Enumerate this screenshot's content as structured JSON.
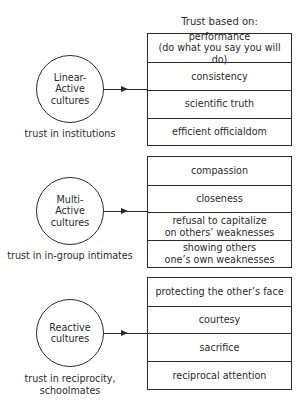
{
  "header": {
    "title": "Trust based on:"
  },
  "groups": [
    {
      "circle_lines": [
        "Linear-",
        "Active",
        "cultures"
      ],
      "caption_lines": [
        "trust in institutions"
      ],
      "items": [
        {
          "lines": [
            "performance",
            "(do what you say you will do)"
          ]
        },
        {
          "lines": [
            "consistency"
          ]
        },
        {
          "lines": [
            "scientific truth"
          ]
        },
        {
          "lines": [
            "efficient officialdom"
          ]
        }
      ]
    },
    {
      "circle_lines": [
        "Multi-",
        "Active",
        "cultures"
      ],
      "caption_lines": [
        "trust in in-group intimates"
      ],
      "items": [
        {
          "lines": [
            "compassion"
          ]
        },
        {
          "lines": [
            "closeness"
          ]
        },
        {
          "lines": [
            "refusal to capitalize",
            "on others’ weaknesses"
          ]
        },
        {
          "lines": [
            "showing others",
            "one’s own weaknesses"
          ]
        }
      ]
    },
    {
      "circle_lines": [
        "Reactive",
        "cultures"
      ],
      "caption_lines": [
        "trust in reciprocity,",
        "schoolmates"
      ],
      "items": [
        {
          "lines": [
            "protecting the other’s face"
          ]
        },
        {
          "lines": [
            "courtesy"
          ]
        },
        {
          "lines": [
            "sacrifice"
          ]
        },
        {
          "lines": [
            "reciprocal attention"
          ]
        }
      ]
    }
  ]
}
